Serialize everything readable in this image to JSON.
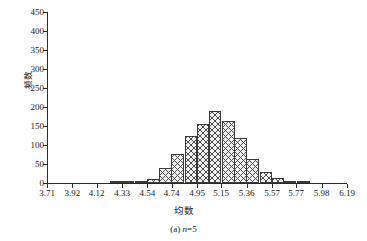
{
  "chart_data": {
    "type": "bar",
    "title": "",
    "subtitle": "",
    "xlabel": "均数",
    "ylabel": "频数",
    "caption_prefix": "(a) ",
    "caption_var": "n",
    "caption_suffix": "=5",
    "xlim": [
      3.71,
      6.19
    ],
    "ylim": [
      0,
      450
    ],
    "grid": false,
    "legend": null,
    "x_tick_labels": [
      "3.71",
      "3.92",
      "4.12",
      "4.33",
      "4.54",
      "4.74",
      "4.95",
      "5.15",
      "5.36",
      "5.57",
      "5.77",
      "5.98",
      "6.19"
    ],
    "y_tick_labels": [
      "0",
      "50",
      "100",
      "150",
      "200",
      "250",
      "300",
      "350",
      "400",
      "450"
    ],
    "y_tick_values": [
      0,
      50,
      100,
      150,
      200,
      250,
      300,
      350,
      400,
      450
    ],
    "bin_width": 0.1033,
    "bin_centers": [
      4.28,
      4.38,
      4.49,
      4.59,
      4.69,
      4.79,
      4.9,
      5.0,
      5.1,
      5.21,
      5.31,
      5.41,
      5.52,
      5.62,
      5.72,
      5.83
    ],
    "values": [
      1,
      2,
      4,
      10,
      40,
      77,
      124,
      156,
      189,
      162,
      119,
      64,
      29,
      13,
      4,
      1
    ],
    "series": [
      {
        "name": "频数",
        "values": [
          1,
          2,
          4,
          10,
          40,
          77,
          124,
          156,
          189,
          162,
          119,
          64,
          29,
          13,
          4,
          1
        ]
      }
    ],
    "categories": [
      "4.28",
      "4.38",
      "4.49",
      "4.59",
      "4.69",
      "4.79",
      "4.90",
      "5.00",
      "5.10",
      "5.21",
      "5.31",
      "5.41",
      "5.52",
      "5.62",
      "5.72",
      "5.83"
    ]
  }
}
